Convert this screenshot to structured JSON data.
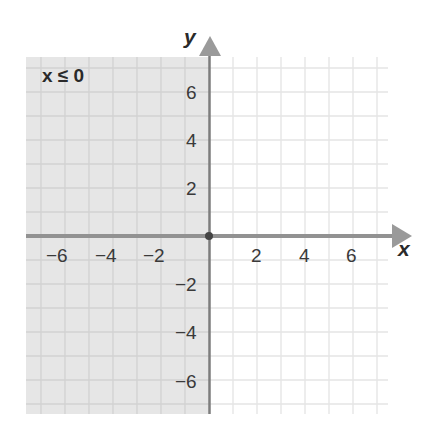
{
  "graph": {
    "x_axis_label": "x",
    "y_axis_label": "y",
    "region_label": "x ≤ 0",
    "inequality": "x <= 0",
    "x_ticks": [
      {
        "value": -6,
        "label": "−6"
      },
      {
        "value": -4,
        "label": "−4"
      },
      {
        "value": -2,
        "label": "−2"
      },
      {
        "value": 2,
        "label": "2"
      },
      {
        "value": 4,
        "label": "4"
      },
      {
        "value": 6,
        "label": "6"
      }
    ],
    "y_ticks": [
      {
        "value": 6,
        "label": "6"
      },
      {
        "value": 4,
        "label": "4"
      },
      {
        "value": 2,
        "label": "2"
      },
      {
        "value": -2,
        "label": "−2"
      },
      {
        "value": -4,
        "label": "−4"
      },
      {
        "value": -6,
        "label": "−6"
      }
    ],
    "x_range": [
      -7.5,
      7.5
    ],
    "y_range": [
      -7.5,
      7.5
    ],
    "boundary_line": "x = 0 (solid)",
    "shaded_side": "left",
    "colors": {
      "shade": "#e6e6e6",
      "grid_shaded": "#d2d2d2",
      "grid_unshaded": "#e4e4e4",
      "axis": "#8f8f8f",
      "boundary": "#7a7a7a",
      "origin_dot": "#444444"
    }
  }
}
